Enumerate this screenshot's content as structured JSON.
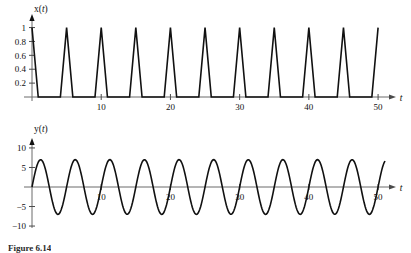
{
  "figure": {
    "caption": "Figure 6.14",
    "background": "#ffffff",
    "curve_color": "#111111",
    "axis_color": "#6a6a6a"
  },
  "chart_data": [
    {
      "type": "line",
      "id": "x-of-t",
      "title": "",
      "ylabel": "x(t)",
      "xlabel": "t",
      "xlim": [
        0,
        51
      ],
      "ylim": [
        0,
        1.08
      ],
      "grid": false,
      "legend": null,
      "xticks": [
        10,
        20,
        30,
        40,
        50
      ],
      "xtick_labels": [
        "10",
        "20",
        "30",
        "40",
        "50"
      ],
      "yticks": [
        0.2,
        0.4,
        0.6,
        0.8,
        1
      ],
      "ytick_labels": [
        "0.2",
        "0.4",
        "0.6",
        "0.8",
        "1"
      ],
      "description": "Periodic narrow triangular pulses, period 5, peak amplitude 1, zero baseline between pulses",
      "period": 5,
      "peak": 1.0,
      "baseline": 0.0,
      "pulse_half_width": 0.9,
      "peak_times": [
        0,
        5,
        10,
        15,
        20,
        25,
        30,
        35,
        40,
        45,
        50
      ],
      "peak_values": [
        1,
        1,
        1,
        1,
        1,
        1,
        1,
        1,
        1,
        1,
        1
      ]
    },
    {
      "type": "line",
      "id": "y-of-t",
      "title": "",
      "ylabel": "y(t)",
      "xlabel": "t",
      "xlim": [
        0,
        51
      ],
      "ylim": [
        -10.5,
        10.5
      ],
      "grid": false,
      "legend": null,
      "xticks": [
        10,
        20,
        30,
        40,
        50
      ],
      "xtick_labels": [
        "10",
        "20",
        "30",
        "40",
        "50"
      ],
      "yticks": [
        -10,
        -5,
        5,
        10
      ],
      "ytick_labels": [
        "−10",
        "−5",
        "5",
        "10"
      ],
      "description": "Sinusoidal oscillation, period 5, amplitude about 7, starting near zero rising",
      "period": 5,
      "amplitude": 7,
      "phase": 0,
      "sample_x": [
        0,
        1.25,
        2.5,
        3.75,
        5,
        6.25,
        7.5,
        8.75,
        10,
        11.25,
        12.5,
        13.75,
        15,
        16.25,
        17.5,
        18.75,
        20,
        21.25,
        22.5,
        23.75,
        25,
        26.25,
        27.5,
        28.75,
        30,
        31.25,
        32.5,
        33.75,
        35,
        36.25,
        37.5,
        38.75,
        40,
        41.25,
        42.5,
        43.75,
        45,
        46.25,
        47.5,
        48.75,
        50
      ],
      "sample_y": [
        0,
        7,
        0,
        -7,
        0,
        7,
        0,
        -7,
        0,
        7,
        0,
        -7,
        0,
        7,
        0,
        -7,
        0,
        7,
        0,
        -7,
        0,
        7,
        0,
        -7,
        0,
        7,
        0,
        -7,
        0,
        7,
        0,
        -7,
        0,
        7,
        0,
        -7,
        0,
        7,
        0,
        -7,
        0
      ]
    }
  ]
}
